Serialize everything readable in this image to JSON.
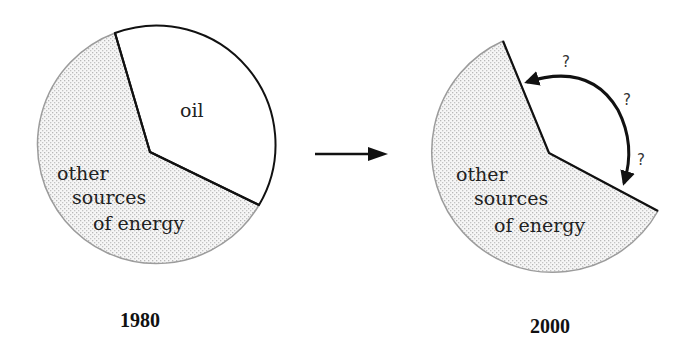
{
  "diagram": {
    "charts": [
      {
        "year": "1980",
        "slices": [
          {
            "label": "oil",
            "fill": "#ffffff",
            "approx_share_percent": 37
          },
          {
            "label_lines": [
              "other",
              "sources",
              "of energy"
            ],
            "fill": "stippled-gray",
            "approx_share_percent": 63
          }
        ]
      },
      {
        "year": "2000",
        "slices": [
          {
            "label": "",
            "fill": "none",
            "note": "missing/unknown wedge marked with ?"
          },
          {
            "label_lines": [
              "other",
              "sources",
              "of energy"
            ],
            "fill": "stippled-gray"
          }
        ],
        "unknown_markers": [
          "?",
          "?",
          "?"
        ]
      }
    ],
    "transition_arrow": "right-arrow"
  },
  "left": {
    "oil_label": "oil",
    "other_line1": "other",
    "other_line2": "sources",
    "other_line3": "of energy",
    "year": "1980"
  },
  "right": {
    "other_line1": "other",
    "other_line2": "sources",
    "other_line3": "of energy",
    "q1": "?",
    "q2": "?",
    "q3": "?",
    "year": "2000"
  },
  "colors": {
    "outline": "#111111",
    "stipple_dot": "#b5b5b5",
    "stipple_bg": "#f4f4f4",
    "circle_edge": "#9a9a9a"
  }
}
